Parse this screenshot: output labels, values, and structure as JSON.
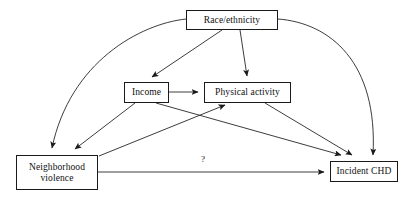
{
  "diagram": {
    "type": "causal-dag",
    "title": "",
    "nodes": [
      {
        "id": "race",
        "label": "Race/ethnicity",
        "x": 186,
        "y": 10,
        "w": 92,
        "h": 20
      },
      {
        "id": "income",
        "label": "Income",
        "x": 124,
        "y": 82,
        "w": 45,
        "h": 21
      },
      {
        "id": "physical",
        "label": "Physical activity",
        "x": 204,
        "y": 82,
        "w": 87,
        "h": 21
      },
      {
        "id": "violence",
        "label": "Neighborhood\nviolence",
        "x": 16,
        "y": 155,
        "w": 82,
        "h": 35
      },
      {
        "id": "chd",
        "label": "Incident CHD",
        "x": 330,
        "y": 161,
        "w": 68,
        "h": 21
      }
    ],
    "edges": [
      {
        "from": "race",
        "to": "violence",
        "label": "",
        "style": "curved"
      },
      {
        "from": "race",
        "to": "income",
        "label": "",
        "style": "straight"
      },
      {
        "from": "race",
        "to": "physical",
        "label": "",
        "style": "straight"
      },
      {
        "from": "race",
        "to": "chd",
        "label": "",
        "style": "curved"
      },
      {
        "from": "income",
        "to": "physical",
        "label": "",
        "style": "straight"
      },
      {
        "from": "income",
        "to": "violence",
        "label": "",
        "style": "straight"
      },
      {
        "from": "income",
        "to": "chd",
        "label": "",
        "style": "straight"
      },
      {
        "from": "violence",
        "to": "physical",
        "label": "",
        "style": "straight"
      },
      {
        "from": "physical",
        "to": "chd",
        "label": "",
        "style": "straight"
      },
      {
        "from": "violence",
        "to": "chd",
        "label": "?",
        "style": "straight"
      }
    ],
    "edge_labels": {
      "question": "?"
    },
    "colors": {
      "background": "#ffffff",
      "stroke": "#1a1a1a",
      "text": "#101010"
    }
  }
}
